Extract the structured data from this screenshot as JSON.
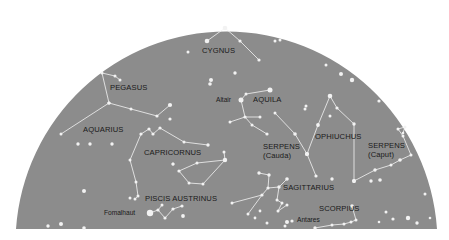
{
  "colors": {
    "sky": "#8c8c8c",
    "background": "#ffffff",
    "stars": "#f2f2f2",
    "lines": "#f4f4f4",
    "text": "#1a1a1a"
  },
  "dome": {
    "cx": 226,
    "baseline_y": 229,
    "rx": 211,
    "ry": 212,
    "left_x": 16,
    "right_x": 437
  },
  "constellations": [
    {
      "name": "CYGNUS",
      "label_x": 202,
      "label_y": 53,
      "stars": [
        [
          207,
          41,
          2.3
        ],
        [
          225,
          28,
          2.3
        ],
        [
          240,
          41,
          1.6
        ],
        [
          259,
          60,
          1.6
        ]
      ],
      "lines": [
        [
          0,
          1
        ],
        [
          1,
          2
        ],
        [
          2,
          3
        ]
      ]
    },
    {
      "name": "PEGASUS",
      "label_x": 110,
      "label_y": 90,
      "stars": [
        [
          102,
          73,
          1.5
        ],
        [
          115,
          76,
          1.5
        ],
        [
          120,
          80,
          1.5
        ],
        [
          109,
          103,
          1.6
        ],
        [
          131,
          109,
          1.5
        ],
        [
          157,
          116,
          1.6
        ],
        [
          170,
          105,
          2.1
        ]
      ],
      "lines": [
        [
          0,
          1
        ],
        [
          1,
          2
        ],
        [
          0,
          3
        ],
        [
          3,
          4
        ],
        [
          4,
          5
        ],
        [
          5,
          6
        ]
      ]
    },
    {
      "name": "AQUARIUS",
      "label_x": 83,
      "label_y": 132,
      "stars": [
        [
          61,
          134,
          1.5
        ],
        [
          109,
          103,
          1.6
        ],
        [
          78,
          144,
          1.7
        ],
        [
          90,
          144,
          1.7
        ],
        [
          112,
          144,
          1.7
        ]
      ],
      "lines": [
        [
          0,
          1
        ]
      ]
    },
    {
      "name": "CAPRICORNUS",
      "label_x": 144,
      "label_y": 155,
      "stars": [
        [
          141,
          134,
          1.6
        ],
        [
          149,
          129,
          1.6
        ],
        [
          153,
          134,
          1.6
        ],
        [
          160,
          128,
          1.6
        ],
        [
          184,
          142,
          1.5
        ],
        [
          208,
          145,
          1.7
        ],
        [
          130,
          160,
          1.5
        ],
        [
          136,
          182,
          1.5
        ],
        [
          138,
          196,
          1.5
        ],
        [
          130,
          198,
          1.5
        ],
        [
          135,
          199,
          1.5
        ]
      ],
      "lines": [
        [
          0,
          1
        ],
        [
          1,
          2
        ],
        [
          2,
          3
        ],
        [
          3,
          4
        ],
        [
          4,
          5
        ],
        [
          0,
          6
        ],
        [
          6,
          7
        ],
        [
          7,
          8
        ],
        [
          8,
          10
        ]
      ]
    },
    {
      "name": "CAPRICORNUS-B",
      "label_x": null,
      "label_y": null,
      "stars": [
        [
          179,
          171,
          1.6
        ],
        [
          189,
          183,
          1.5
        ],
        [
          203,
          184,
          1.5
        ],
        [
          225,
          160,
          2.2
        ],
        [
          197,
          163,
          1.5
        ],
        [
          224,
          152,
          1.5
        ],
        [
          173,
          164,
          1.5
        ]
      ],
      "lines": [
        [
          0,
          1
        ],
        [
          1,
          2
        ],
        [
          2,
          3
        ],
        [
          3,
          4
        ],
        [
          4,
          0
        ],
        [
          3,
          5
        ]
      ]
    },
    {
      "name": "PISCIS AUSTRINUS",
      "label_x": 145,
      "label_y": 201,
      "stars": [
        [
          150,
          213,
          3.2
        ],
        [
          158,
          210,
          1.6
        ],
        [
          165,
          218,
          1.6
        ],
        [
          173,
          209,
          1.6
        ],
        [
          182,
          206,
          1.6
        ],
        [
          162,
          205,
          1.5
        ],
        [
          183,
          216,
          1.9
        ]
      ],
      "lines": [
        [
          0,
          1
        ],
        [
          1,
          2
        ],
        [
          2,
          3
        ],
        [
          3,
          4
        ],
        [
          1,
          5
        ]
      ]
    },
    {
      "name": "AQUILA",
      "label_x": 253,
      "label_y": 102,
      "stars": [
        [
          241,
          100,
          2.5
        ],
        [
          246,
          94,
          1.5
        ],
        [
          270,
          90,
          2.5
        ],
        [
          245,
          117,
          1.6
        ],
        [
          230,
          122,
          1.5
        ],
        [
          260,
          117,
          1.5
        ],
        [
          252,
          125,
          1.5
        ],
        [
          267,
          134,
          1.6
        ]
      ],
      "lines": [
        [
          1,
          2
        ],
        [
          0,
          1
        ],
        [
          0,
          3
        ],
        [
          3,
          4
        ],
        [
          3,
          5
        ],
        [
          3,
          6
        ],
        [
          6,
          7
        ]
      ]
    },
    {
      "name": "SERPENS (Cauda)",
      "label_x": 263,
      "label_y": 149,
      "stars": [
        [
          275,
          113,
          1.5
        ],
        [
          295,
          134,
          1.8
        ],
        [
          307,
          154,
          2.0
        ],
        [
          316,
          176,
          1.6
        ]
      ],
      "lines": [
        [
          0,
          1
        ],
        [
          1,
          2
        ],
        [
          2,
          3
        ]
      ]
    },
    {
      "name": "OPHIUCHUS",
      "label_x": 315,
      "label_y": 139,
      "stars": [
        [
          307,
          154,
          2.0
        ],
        [
          318,
          125,
          1.9
        ],
        [
          330,
          96,
          2.3
        ],
        [
          337,
          108,
          1.6
        ],
        [
          354,
          124,
          1.7
        ],
        [
          354,
          181,
          1.9
        ],
        [
          305,
          109,
          1.5
        ]
      ],
      "lines": [
        [
          0,
          1
        ],
        [
          1,
          2
        ],
        [
          2,
          3
        ],
        [
          3,
          4
        ],
        [
          4,
          5
        ]
      ]
    },
    {
      "name": "SERPENS (Caput)",
      "label_x": 368,
      "label_y": 148,
      "stars": [
        [
          354,
          181,
          1.9
        ],
        [
          375,
          170,
          1.7
        ],
        [
          391,
          165,
          1.5
        ],
        [
          400,
          160,
          1.8
        ],
        [
          411,
          155,
          1.5
        ],
        [
          403,
          136,
          1.5
        ],
        [
          398,
          129,
          1.5
        ],
        [
          405,
          127,
          1.5
        ],
        [
          403,
          133,
          1.3
        ],
        [
          371,
          181,
          1.7
        ]
      ],
      "lines": [
        [
          0,
          1
        ],
        [
          1,
          2
        ],
        [
          2,
          3
        ],
        [
          3,
          4
        ],
        [
          4,
          5
        ],
        [
          5,
          6
        ],
        [
          6,
          7
        ],
        [
          7,
          8
        ]
      ]
    },
    {
      "name": "SAGITTARIUS",
      "label_x": 283,
      "label_y": 190,
      "stars": [
        [
          259,
          173,
          1.7
        ],
        [
          269,
          175,
          1.7
        ],
        [
          268,
          188,
          1.6
        ],
        [
          279,
          187,
          1.7
        ],
        [
          287,
          179,
          1.8
        ],
        [
          262,
          195,
          1.6
        ],
        [
          277,
          200,
          1.5
        ],
        [
          282,
          203,
          1.5
        ],
        [
          278,
          211,
          1.5
        ],
        [
          287,
          205,
          1.5
        ],
        [
          232,
          203,
          1.5
        ],
        [
          248,
          214,
          1.5
        ],
        [
          260,
          211,
          1.4
        ],
        [
          255,
          218,
          1.4
        ],
        [
          267,
          223,
          1.5
        ]
      ],
      "lines": [
        [
          0,
          1
        ],
        [
          1,
          2
        ],
        [
          2,
          3
        ],
        [
          3,
          4
        ],
        [
          2,
          5
        ],
        [
          3,
          6
        ],
        [
          6,
          7
        ],
        [
          7,
          8
        ],
        [
          8,
          9
        ],
        [
          5,
          10
        ],
        [
          5,
          11
        ]
      ]
    },
    {
      "name": "SCORPIUS",
      "label_x": 319,
      "label_y": 211,
      "stars": [
        [
          287,
          222,
          2.0
        ],
        [
          292,
          221,
          1.6
        ],
        [
          315,
          228,
          1.7
        ],
        [
          332,
          225,
          1.5
        ],
        [
          344,
          224,
          1.5
        ],
        [
          351,
          222,
          1.5
        ],
        [
          356,
          220,
          1.5
        ],
        [
          352,
          206,
          1.8
        ],
        [
          285,
          226,
          1.5
        ]
      ],
      "lines": [
        [
          2,
          3
        ],
        [
          3,
          4
        ],
        [
          4,
          5
        ],
        [
          5,
          6
        ],
        [
          6,
          7
        ]
      ]
    }
  ],
  "named_stars": [
    {
      "name": "Altair",
      "x": 241,
      "y": 100,
      "label_x": 216,
      "label_y": 102
    },
    {
      "name": "Fomalhaut",
      "x": 150,
      "y": 213,
      "label_x": 104,
      "label_y": 215
    },
    {
      "name": "Antares",
      "x": 287,
      "y": 222,
      "label_x": 297,
      "label_y": 222
    }
  ],
  "loose_stars": [
    [
      188,
      52,
      1.5
    ],
    [
      211,
      80,
      2.0
    ],
    [
      210,
      84,
      1.8
    ],
    [
      275,
      41,
      1.5
    ],
    [
      280,
      40,
      1.5
    ],
    [
      235,
      73,
      1.7
    ],
    [
      326,
      65,
      1.5
    ],
    [
      341,
      74,
      2.0
    ],
    [
      352,
      80,
      2.2
    ],
    [
      379,
      101,
      1.6
    ],
    [
      306,
      106,
      1.5
    ],
    [
      330,
      116,
      1.5
    ],
    [
      84,
      191,
      2.0
    ],
    [
      48,
      226,
      1.7
    ],
    [
      61,
      224,
      2.0
    ],
    [
      84,
      228,
      1.8
    ],
    [
      332,
      179,
      1.7
    ],
    [
      380,
      180,
      1.8
    ],
    [
      386,
      212,
      1.5
    ],
    [
      425,
      194,
      1.5
    ],
    [
      393,
      219,
      1.6
    ],
    [
      408,
      218,
      2.2
    ],
    [
      417,
      223,
      1.7
    ],
    [
      379,
      222,
      1.3
    ],
    [
      430,
      218,
      1.3
    ],
    [
      170,
      119,
      1.6
    ],
    [
      173,
      164,
      1.5
    ]
  ]
}
